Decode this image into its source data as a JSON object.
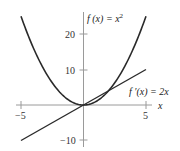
{
  "chart_data": {
    "type": "line",
    "title": "",
    "xlabel": "x",
    "ylabel": "",
    "xlim": [
      -5,
      5
    ],
    "ylim": [
      -10,
      25
    ],
    "grid": false,
    "x_ticks": [
      -5,
      5
    ],
    "x_tick_labels": [
      "−5",
      "5"
    ],
    "y_ticks": [
      -10,
      10,
      20
    ],
    "y_tick_labels": [
      "−10",
      "10",
      "20"
    ],
    "series": [
      {
        "name": "f(x) = x^2",
        "label": "f (x) = x²",
        "x": [
          -5,
          -4,
          -3,
          -2,
          -1,
          0,
          1,
          2,
          3,
          4,
          5
        ],
        "values": [
          25,
          16,
          9,
          4,
          1,
          0,
          1,
          4,
          9,
          16,
          25
        ]
      },
      {
        "name": "f'(x) = 2x",
        "label": "f ′(x) = 2x",
        "x": [
          -5,
          5
        ],
        "values": [
          -10,
          10
        ]
      }
    ],
    "annotations": [
      {
        "text": "f (x) = x²",
        "near": [
          1,
          24
        ]
      },
      {
        "text": "f ′(x) = 2x",
        "near": [
          4.2,
          4.5
        ]
      }
    ]
  },
  "labels": {
    "x_axis": "x",
    "tick_neg5": "−5",
    "tick_5": "5",
    "tick_20": "20",
    "tick_10": "10",
    "tick_neg10": "−10",
    "f_label_main": "f (x) = x",
    "f_label_sup": "2",
    "fp_label": "f ′(x) = 2x"
  },
  "colors": {
    "curve": "#2a2a2a",
    "axis": "#9a9a9a",
    "text": "#333333"
  }
}
